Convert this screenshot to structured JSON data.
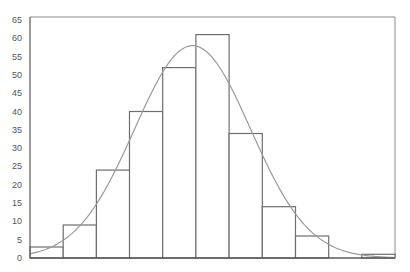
{
  "chart_data": {
    "type": "bar",
    "subtype": "histogram_with_normal_curve",
    "title": "",
    "xlabel": "",
    "ylabel": "",
    "ylim": [
      0,
      65
    ],
    "yticks": [
      0,
      5,
      10,
      15,
      20,
      25,
      30,
      35,
      40,
      45,
      50,
      55,
      60,
      65
    ],
    "xticks": [],
    "bins": 11,
    "values": [
      3,
      9,
      24,
      40,
      52,
      61,
      34,
      14,
      6,
      0,
      1
    ],
    "overlay": {
      "type": "normal_curve",
      "peak_value": 58,
      "peak_bin_position": 4.9,
      "sd_bins": 1.75
    },
    "grid": false,
    "legend": null
  },
  "colors": {
    "bar_stroke": "#6e6e6e",
    "bar_fill": "#ffffff",
    "curve": "#9a9a9a",
    "frame": "#8a8a8a",
    "axis": "#5a5a5a",
    "tick_text": "#555555"
  }
}
